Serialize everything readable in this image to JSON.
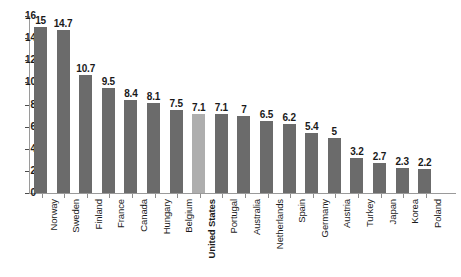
{
  "chart_data": {
    "type": "bar",
    "title": "",
    "xlabel": "",
    "ylabel": "",
    "ylim": [
      0,
      16
    ],
    "yticks": [
      0,
      2,
      4,
      6,
      8,
      10,
      12,
      14,
      16
    ],
    "grid": false,
    "legend": "none",
    "highlight_category": "United States",
    "colors": {
      "bar": "#6b6b6b",
      "bar_highlight": "#aeaeae",
      "axis": "#9a9a9a",
      "text": "#1a1a1a",
      "background": "#ffffff"
    },
    "categories": [
      "Norway",
      "Sweden",
      "Finland",
      "France",
      "Canada",
      "Hungary",
      "Belgium",
      "United States",
      "Portugal",
      "Australia",
      "Netherlands",
      "Spain",
      "Germany",
      "Austria",
      "Turkey",
      "Japan",
      "Korea",
      "Poland"
    ],
    "values": [
      15,
      14.7,
      10.7,
      9.5,
      8.4,
      8.1,
      7.5,
      7.1,
      7.1,
      7,
      6.5,
      6.2,
      5.4,
      5,
      3.2,
      2.7,
      2.3,
      2.2
    ],
    "points": [
      {
        "category": "Norway",
        "value": 15,
        "label": "15",
        "highlight": false
      },
      {
        "category": "Sweden",
        "value": 14.7,
        "label": "14.7",
        "highlight": false
      },
      {
        "category": "Finland",
        "value": 10.7,
        "label": "10.7",
        "highlight": false
      },
      {
        "category": "France",
        "value": 9.5,
        "label": "9.5",
        "highlight": false
      },
      {
        "category": "Canada",
        "value": 8.4,
        "label": "8.4",
        "highlight": false
      },
      {
        "category": "Hungary",
        "value": 8.1,
        "label": "8.1",
        "highlight": false
      },
      {
        "category": "Belgium",
        "value": 7.5,
        "label": "7.5",
        "highlight": false
      },
      {
        "category": "United States",
        "value": 7.1,
        "label": "7.1",
        "highlight": true
      },
      {
        "category": "Portugal",
        "value": 7.1,
        "label": "7.1",
        "highlight": false
      },
      {
        "category": "Australia",
        "value": 7,
        "label": "7",
        "highlight": false
      },
      {
        "category": "Netherlands",
        "value": 6.5,
        "label": "6.5",
        "highlight": false
      },
      {
        "category": "Spain",
        "value": 6.2,
        "label": "6.2",
        "highlight": false
      },
      {
        "category": "Germany",
        "value": 5.4,
        "label": "5.4",
        "highlight": false
      },
      {
        "category": "Austria",
        "value": 5,
        "label": "5",
        "highlight": false
      },
      {
        "category": "Turkey",
        "value": 3.2,
        "label": "3.2",
        "highlight": false
      },
      {
        "category": "Japan",
        "value": 2.7,
        "label": "2.7",
        "highlight": false
      },
      {
        "category": "Korea",
        "value": 2.3,
        "label": "2.3",
        "highlight": false
      },
      {
        "category": "Poland",
        "value": 2.2,
        "label": "2.2",
        "highlight": false
      }
    ]
  }
}
